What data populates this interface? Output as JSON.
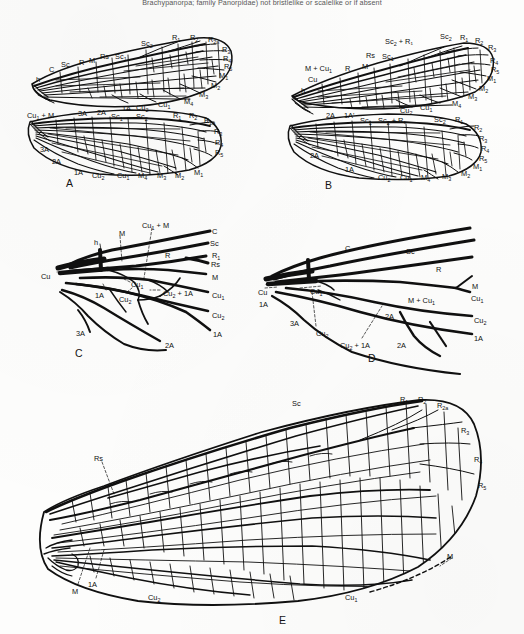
{
  "page": {
    "header_text": "Brachypanorpa; family Panorpidae) not bristlelike or scalelike or if absent",
    "background_color": "#fdfdfc",
    "ink_color": "#101010"
  },
  "figures": [
    {
      "letter": "A",
      "name": "figure-a-wing-venation",
      "labels_forewing": [
        "h",
        "C",
        "Sc",
        "R",
        "M",
        "Rs",
        "Sc1",
        "Sc2",
        "R1",
        "R2",
        "R2a",
        "R3",
        "R4",
        "R5",
        "M1",
        "M2",
        "M3",
        "M4",
        "Cu1",
        "Cu2",
        "1A",
        "2A"
      ],
      "labels_hindwing": [
        "Cu1 + M",
        "3A",
        "2A",
        "Sc1",
        "Sc2",
        "R1",
        "R2",
        "R2a",
        "R3",
        "R4",
        "R5",
        "M1",
        "M2",
        "M3",
        "M4",
        "Cu1",
        "Cu2",
        "1A"
      ]
    },
    {
      "letter": "B",
      "name": "figure-b-wing-venation",
      "labels_forewing": [
        "h",
        "Cu",
        "M + Cu1",
        "R",
        "M",
        "Rs",
        "Sc1",
        "Sc2 + R1",
        "Sc2",
        "R1",
        "R2",
        "R3",
        "R4",
        "R5",
        "M1",
        "M2",
        "M3",
        "M4",
        "Cu1",
        "Cu2",
        "1A",
        "2A",
        "1A'"
      ],
      "labels_hindwing": [
        "2A",
        "1A",
        "Sc1",
        "Sc2 + R1",
        "Sc2",
        "R1",
        "R2",
        "R3",
        "R4",
        "R5",
        "M1",
        "M2",
        "M3",
        "M4",
        "Cu1",
        "Cu2"
      ]
    },
    {
      "letter": "C",
      "name": "figure-c-wing-base-detail",
      "labels": [
        "h",
        "M",
        "Cu1 + M",
        "C",
        "Sc",
        "R",
        "R1",
        "Rs",
        "Cu",
        "Cu1",
        "Cu2",
        "Cu2 + 1A",
        "1A",
        "2A",
        "3A"
      ]
    },
    {
      "letter": "D",
      "name": "figure-d-wing-base-detail",
      "labels": [
        "C",
        "Sc",
        "R",
        "M",
        "Cu",
        "Cu1",
        "M + Cu1",
        "Cu2",
        "Cu2 + 1A",
        "1A",
        "2A",
        "3A"
      ]
    },
    {
      "letter": "E",
      "name": "figure-e-full-wing",
      "labels": [
        "Sc",
        "Rs",
        "R1",
        "R2",
        "R2a",
        "R3",
        "R4",
        "R5",
        "M",
        "1A",
        "Cu1",
        "Cu2"
      ]
    }
  ],
  "labels": {
    "A": {
      "fore": [
        {
          "t": "h",
          "x": 36,
          "y": 76
        },
        {
          "t": "C",
          "x": 49,
          "y": 66
        },
        {
          "t": "Sc",
          "x": 61,
          "y": 61
        },
        {
          "t": "R",
          "x": 79,
          "y": 59
        },
        {
          "t": "M",
          "x": 89,
          "y": 57
        },
        {
          "t": "Rs",
          "x": 100,
          "y": 53
        },
        {
          "t": "Sc",
          "sub": "1",
          "x": 115,
          "y": 53
        },
        {
          "t": "Sc",
          "sub": "2",
          "x": 141,
          "y": 40
        },
        {
          "t": "R",
          "sub": "1",
          "x": 172,
          "y": 34
        },
        {
          "t": "R",
          "sub": "2",
          "x": 190,
          "y": 34
        },
        {
          "t": "R",
          "sub": "2a",
          "x": 208,
          "y": 36
        },
        {
          "t": "R",
          "sub": "3",
          "x": 222,
          "y": 46
        },
        {
          "t": "R",
          "sub": "4",
          "x": 223,
          "y": 55
        },
        {
          "t": "R",
          "sub": "5",
          "x": 224,
          "y": 63
        },
        {
          "t": "M",
          "sub": "1",
          "x": 219,
          "y": 72
        },
        {
          "t": "M",
          "sub": "2",
          "x": 211,
          "y": 82
        },
        {
          "t": "M",
          "sub": "3",
          "x": 199,
          "y": 91
        },
        {
          "t": "M",
          "sub": "4",
          "x": 184,
          "y": 98
        },
        {
          "t": "Cu",
          "sub": "1",
          "x": 158,
          "y": 101
        },
        {
          "t": "Cu",
          "sub": "2",
          "x": 136,
          "y": 104
        },
        {
          "t": "1A",
          "x": 122,
          "y": 105
        },
        {
          "t": "2A",
          "x": 97,
          "y": 109
        },
        {
          "t": "Sc",
          "sub": "1",
          "x": 111,
          "y": 113
        },
        {
          "t": "Sc",
          "sub": "2",
          "x": 136,
          "y": 113
        }
      ],
      "hind": [
        {
          "t": "Cu",
          "sub": "1",
          "x": 27,
          "y": 112,
          "suffix": " + M"
        },
        {
          "t": "3A",
          "x": 78,
          "y": 110
        },
        {
          "t": "R",
          "sub": "1",
          "x": 173,
          "y": 112
        },
        {
          "t": "R",
          "sub": "2",
          "x": 189,
          "y": 112
        },
        {
          "t": "R",
          "sub": "2a",
          "x": 204,
          "y": 117
        },
        {
          "t": "R",
          "sub": "3",
          "x": 214,
          "y": 128
        },
        {
          "t": "R",
          "sub": "4",
          "x": 215,
          "y": 139
        },
        {
          "t": "R",
          "sub": "5",
          "x": 215,
          "y": 149
        },
        {
          "t": "3A",
          "x": 40,
          "y": 146
        },
        {
          "t": "2A",
          "x": 52,
          "y": 158
        },
        {
          "t": "1A",
          "x": 74,
          "y": 169
        },
        {
          "t": "Cu",
          "sub": "2",
          "x": 92,
          "y": 172
        },
        {
          "t": "Cu",
          "sub": "1",
          "x": 117,
          "y": 172
        },
        {
          "t": "M",
          "sub": "4",
          "x": 138,
          "y": 172
        },
        {
          "t": "M",
          "sub": "3",
          "x": 157,
          "y": 172
        },
        {
          "t": "M",
          "sub": "2",
          "x": 175,
          "y": 172
        },
        {
          "t": "M",
          "sub": "1",
          "x": 194,
          "y": 169
        }
      ]
    },
    "B": {
      "fore": [
        {
          "t": "h",
          "x": 301,
          "y": 87
        },
        {
          "t": "Cu",
          "x": 308,
          "y": 76
        },
        {
          "t": "M + Cu",
          "sub": "1",
          "x": 305,
          "y": 65
        },
        {
          "t": "R",
          "x": 345,
          "y": 65
        },
        {
          "t": "M",
          "x": 362,
          "y": 63
        },
        {
          "t": "Rs",
          "x": 366,
          "y": 52
        },
        {
          "t": "Sc",
          "sub": "1",
          "x": 382,
          "y": 53
        },
        {
          "t": "Sc",
          "sub": "2",
          "x": 385,
          "y": 38,
          "suffix": " + R₁"
        },
        {
          "t": "Sc",
          "sub": "2",
          "x": 440,
          "y": 33
        },
        {
          "t": "R",
          "sub": "1",
          "x": 460,
          "y": 34
        },
        {
          "t": "R",
          "sub": "2",
          "x": 475,
          "y": 37
        },
        {
          "t": "R",
          "sub": "3",
          "x": 488,
          "y": 44
        },
        {
          "t": "R",
          "sub": "4",
          "x": 490,
          "y": 57
        },
        {
          "t": "R",
          "sub": "5",
          "x": 491,
          "y": 66
        },
        {
          "t": "M",
          "sub": "1",
          "x": 487,
          "y": 75
        },
        {
          "t": "M",
          "sub": "2",
          "x": 479,
          "y": 85
        },
        {
          "t": "M",
          "sub": "3",
          "x": 468,
          "y": 93
        },
        {
          "t": "M",
          "sub": "4",
          "x": 452,
          "y": 100
        },
        {
          "t": "Cu",
          "sub": "1",
          "x": 420,
          "y": 104
        },
        {
          "t": "Cu",
          "sub": "2",
          "x": 400,
          "y": 107
        },
        {
          "t": "2A",
          "x": 326,
          "y": 112
        },
        {
          "t": "1A'",
          "x": 344,
          "y": 112
        }
      ],
      "hind": [
        {
          "t": "Sc",
          "sub": "1",
          "x": 360,
          "y": 117
        },
        {
          "t": "Sc",
          "sub": "2",
          "x": 378,
          "y": 117,
          "suffix": " + R₁"
        },
        {
          "t": "Sc",
          "sub": "2",
          "x": 434,
          "y": 116
        },
        {
          "t": "R",
          "sub": "1",
          "x": 455,
          "y": 116
        },
        {
          "t": "R",
          "sub": "2",
          "x": 474,
          "y": 124
        },
        {
          "t": "R",
          "sub": "3",
          "x": 479,
          "y": 135
        },
        {
          "t": "R",
          "sub": "4",
          "x": 481,
          "y": 145
        },
        {
          "t": "R",
          "sub": "5",
          "x": 479,
          "y": 155
        },
        {
          "t": "2A",
          "x": 310,
          "y": 152
        },
        {
          "t": "1A",
          "x": 345,
          "y": 166
        },
        {
          "t": "Cu",
          "sub": "2",
          "x": 378,
          "y": 174
        },
        {
          "t": "Cu",
          "sub": "1",
          "x": 400,
          "y": 174
        },
        {
          "t": "M",
          "sub": "4",
          "x": 421,
          "y": 174
        },
        {
          "t": "M",
          "sub": "3",
          "x": 442,
          "y": 173
        },
        {
          "t": "M",
          "sub": "2",
          "x": 461,
          "y": 170
        },
        {
          "t": "M",
          "sub": "1",
          "x": 473,
          "y": 163
        }
      ]
    },
    "C": [
      {
        "t": "h",
        "x": 94,
        "y": 239
      },
      {
        "t": "M",
        "x": 119,
        "y": 230
      },
      {
        "t": "Cu",
        "sub": "1",
        "x": 142,
        "y": 222,
        "suffix": " + M"
      },
      {
        "t": "C",
        "x": 212,
        "y": 228
      },
      {
        "t": "Sc",
        "x": 210,
        "y": 240
      },
      {
        "t": "R",
        "sub": "1",
        "x": 212,
        "y": 252
      },
      {
        "t": "Rs",
        "x": 211,
        "y": 261
      },
      {
        "t": "R",
        "x": 165,
        "y": 252
      },
      {
        "t": "M",
        "x": 212,
        "y": 274
      },
      {
        "t": "Cu",
        "x": 41,
        "y": 273
      },
      {
        "t": "Cu",
        "sub": "1",
        "x": 131,
        "y": 281
      },
      {
        "t": "Cu",
        "sub": "1",
        "x": 212,
        "y": 292
      },
      {
        "t": "Cu",
        "sub": "2",
        "x": 119,
        "y": 296
      },
      {
        "t": "Cu",
        "sub": "2",
        "x": 163,
        "y": 290,
        "suffix": " + 1A"
      },
      {
        "t": "Cu",
        "sub": "2",
        "x": 212,
        "y": 312
      },
      {
        "t": "1A",
        "x": 95,
        "y": 292
      },
      {
        "t": "1A",
        "x": 213,
        "y": 331
      },
      {
        "t": "2A",
        "x": 165,
        "y": 342
      },
      {
        "t": "3A",
        "x": 76,
        "y": 330
      }
    ],
    "D": [
      {
        "t": "C",
        "x": 345,
        "y": 245
      },
      {
        "t": "Sc",
        "x": 406,
        "y": 248
      },
      {
        "t": "R",
        "x": 436,
        "y": 266
      },
      {
        "t": "M",
        "x": 472,
        "y": 283
      },
      {
        "t": "Cu",
        "x": 258,
        "y": 289
      },
      {
        "t": "Cu",
        "sub": "1",
        "x": 310,
        "y": 288
      },
      {
        "t": "M + Cu",
        "sub": "1",
        "x": 408,
        "y": 297
      },
      {
        "t": "Cu",
        "sub": "1",
        "x": 471,
        "y": 295
      },
      {
        "t": "Cu",
        "sub": "2",
        "x": 474,
        "y": 317
      },
      {
        "t": "Cu",
        "sub": "2",
        "x": 316,
        "y": 330
      },
      {
        "t": "Cu",
        "sub": "2",
        "x": 340,
        "y": 342,
        "suffix": " + 1A"
      },
      {
        "t": "1A",
        "x": 259,
        "y": 301
      },
      {
        "t": "1A",
        "x": 474,
        "y": 335
      },
      {
        "t": "2A",
        "x": 385,
        "y": 313
      },
      {
        "t": "2A",
        "x": 397,
        "y": 342
      },
      {
        "t": "3A",
        "x": 290,
        "y": 320
      }
    ],
    "E": [
      {
        "t": "Sc",
        "x": 292,
        "y": 400
      },
      {
        "t": "Rs",
        "x": 94,
        "y": 455
      },
      {
        "t": "R",
        "sub": "1",
        "x": 400,
        "y": 396
      },
      {
        "t": "R",
        "sub": "2",
        "x": 418,
        "y": 396
      },
      {
        "t": "R",
        "sub": "2a",
        "x": 437,
        "y": 402
      },
      {
        "t": "R",
        "sub": "3",
        "x": 461,
        "y": 427
      },
      {
        "t": "R",
        "sub": "4",
        "x": 474,
        "y": 456
      },
      {
        "t": "R",
        "sub": "5",
        "x": 478,
        "y": 482
      },
      {
        "t": "M",
        "x": 447,
        "y": 553
      },
      {
        "t": "M",
        "x": 72,
        "y": 588
      },
      {
        "t": "1A",
        "x": 88,
        "y": 581
      },
      {
        "t": "Cu",
        "sub": "2",
        "x": 148,
        "y": 594
      },
      {
        "t": "Cu",
        "sub": "1",
        "x": 345,
        "y": 594
      }
    ]
  },
  "figure_letters": [
    {
      "letter": "A",
      "x": 66,
      "y": 177
    },
    {
      "letter": "B",
      "x": 325,
      "y": 179
    },
    {
      "letter": "C",
      "x": 75,
      "y": 347
    },
    {
      "letter": "D",
      "x": 368,
      "y": 352
    },
    {
      "letter": "E",
      "x": 279,
      "y": 614
    }
  ]
}
